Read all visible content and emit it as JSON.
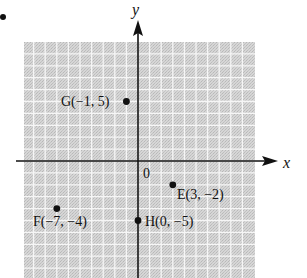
{
  "figure": {
    "list_marker": "•",
    "axes": {
      "x_label": "x",
      "y_label": "y",
      "origin_label": "0"
    },
    "colors": {
      "grid_fill": "#cfcfcf",
      "grid_line": "#f4f4f4",
      "axis": "#111111",
      "point": "#111111"
    },
    "points": [
      {
        "name": "G",
        "x": -1,
        "y": 5,
        "label": "G(−1, 5)"
      },
      {
        "name": "E",
        "x": 3,
        "y": -2,
        "label": "E(3, −2)"
      },
      {
        "name": "F",
        "x": -7,
        "y": -4,
        "label": "F(−7, −4)"
      },
      {
        "name": "H",
        "x": 0,
        "y": -5,
        "label": "H(0, −5)"
      }
    ]
  },
  "chart_data": {
    "type": "scatter",
    "title": "",
    "xlabel": "x",
    "ylabel": "y",
    "grid": true,
    "xlim": [
      -9.7,
      10
    ],
    "ylim": [
      -10,
      10
    ],
    "points": [
      {
        "label": "G(−1, 5)",
        "x": -1,
        "y": 5
      },
      {
        "label": "E(3, −2)",
        "x": 3,
        "y": -2
      },
      {
        "label": "F(−7, −4)",
        "x": -7,
        "y": -4
      },
      {
        "label": "H(0, −5)",
        "x": 0,
        "y": -5
      }
    ],
    "annotations": [
      "0"
    ]
  }
}
